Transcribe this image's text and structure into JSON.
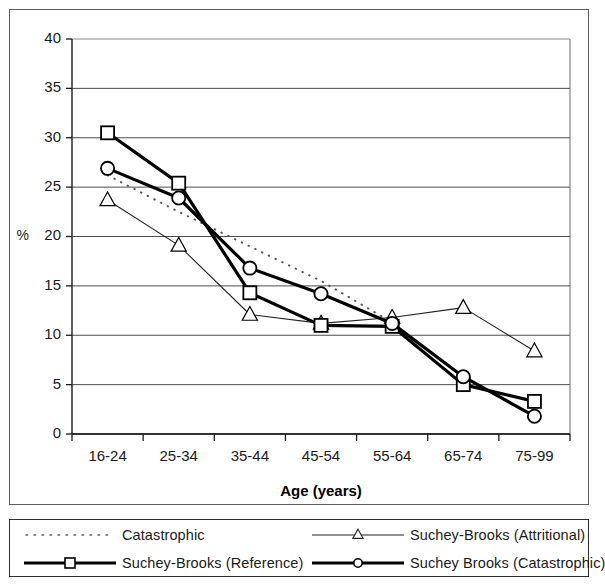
{
  "chart_data": {
    "type": "line",
    "title": "",
    "xlabel": "Age (years)",
    "ylabel": "%",
    "categories": [
      "16-24",
      "25-34",
      "35-44",
      "45-54",
      "55-64",
      "65-74",
      "75-99"
    ],
    "ylim": [
      0,
      40
    ],
    "yticks": [
      0,
      5,
      10,
      15,
      20,
      25,
      30,
      35,
      40
    ],
    "grid": "horizontal",
    "legend_position": "bottom",
    "series": [
      {
        "name": "Catastrophic",
        "marker": "none",
        "line_style": "dotted",
        "line_width": "thin",
        "color": "#555555",
        "values": [
          26.2,
          22.5,
          19.0,
          15.5,
          11.3,
          null,
          null
        ]
      },
      {
        "name": "Suchey-Brooks (Attritional)",
        "marker": "triangle",
        "line_style": "solid",
        "line_width": "thin",
        "color": "#222222",
        "values": [
          23.7,
          19.1,
          12.1,
          11.2,
          11.8,
          12.8,
          8.4
        ]
      },
      {
        "name": "Suchey-Brooks (Reference)",
        "marker": "square",
        "line_style": "solid",
        "line_width": "thick",
        "color": "#000000",
        "values": [
          30.5,
          25.4,
          14.3,
          11.0,
          10.9,
          5.0,
          3.3
        ]
      },
      {
        "name": "Suchey Brooks (Catastrophic)",
        "marker": "circle",
        "line_style": "solid",
        "line_width": "thick",
        "color": "#000000",
        "values": [
          26.9,
          23.9,
          16.8,
          14.2,
          11.2,
          5.8,
          1.8
        ]
      }
    ]
  },
  "axes": {
    "y_label": "%",
    "y_tick_labels": [
      "40",
      "35",
      "30",
      "25",
      "20",
      "15",
      "10",
      "5",
      "0"
    ],
    "x_tick_labels": [
      "16-24",
      "25-34",
      "35-44",
      "45-54",
      "55-64",
      "65-74",
      "75-99"
    ],
    "x_axis_title": "Age (years)"
  },
  "legend": {
    "entries": [
      {
        "label": "Catastrophic",
        "marker": "none",
        "style": "dotted"
      },
      {
        "label": "Suchey-Brooks (Attritional)",
        "marker": "triangle",
        "style": "thin-solid"
      },
      {
        "label": "Suchey-Brooks (Reference)",
        "marker": "square",
        "style": "thick-solid"
      },
      {
        "label": "Suchey Brooks (Catastrophic)",
        "marker": "circle",
        "style": "thick-solid"
      }
    ]
  },
  "colors": {
    "background": "#ffffff",
    "frame": "#5c5c5c",
    "grid": "#4d4d4d",
    "ink": "#000000"
  }
}
